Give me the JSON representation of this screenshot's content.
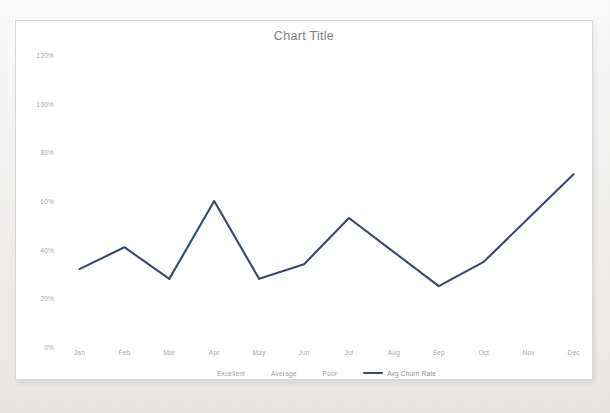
{
  "card": {
    "title": "Chart Title",
    "background": "#ffffff",
    "border_color": "#d9d9d9"
  },
  "chart_data": {
    "type": "line",
    "title": "Chart Title",
    "xlabel": "",
    "ylabel": "",
    "categories": [
      "Jan",
      "Feb",
      "Mar",
      "Apr",
      "May",
      "Jun",
      "Jul",
      "Aug",
      "Sep",
      "Oct",
      "Nov",
      "Dec"
    ],
    "series": [
      {
        "name": "Avg Churn Rate",
        "color": "#3a4a63",
        "values": [
          32,
          41,
          28,
          60,
          28,
          34,
          53,
          39,
          25,
          35,
          53,
          71
        ]
      }
    ],
    "ylim": [
      0,
      120
    ],
    "ytick_values": [
      0,
      20,
      40,
      60,
      80,
      100,
      120
    ],
    "ytick_labels": [
      "0%",
      "20%",
      "40%",
      "60%",
      "80%",
      "100%",
      "120%"
    ],
    "grid": false,
    "legend_position": "bottom",
    "legend_entries": [
      {
        "label": "Excellent",
        "type": "text"
      },
      {
        "label": "Average",
        "type": "text"
      },
      {
        "label": "Poor",
        "type": "text"
      },
      {
        "label": "Avg Churn Rate",
        "type": "line",
        "color": "#3a4a63"
      }
    ]
  },
  "axis": {
    "tick_color": "#a8a8a8"
  }
}
